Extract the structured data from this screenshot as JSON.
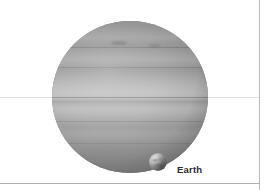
{
  "figure": {
    "caption_labels": {
      "earth": "Earth"
    },
    "objects": [
      {
        "name": "gas-giant",
        "label": "",
        "center_x": 130,
        "center_y": 97,
        "diameter_px": 156,
        "appearance": "banded grayscale gas giant disc with latitudinal cloud bands"
      },
      {
        "name": "earth",
        "label": "Earth",
        "center_x": 158,
        "center_y": 162,
        "diameter_px": 18,
        "appearance": "small mottled grayscale sphere"
      }
    ],
    "colors": {
      "background": "#ffffff",
      "planet_base": "#9a9a9a",
      "planet_equator_zone": "#c2c2c2",
      "planet_polar": "#8a8a8a",
      "earth_base": "#b2b2b2",
      "label_text": "#2b2b2b",
      "frame_border": "#b9b9b9",
      "horizontal_rule": "#e2e2e2"
    },
    "rules": {
      "horizontal_rule_y": 97
    }
  }
}
